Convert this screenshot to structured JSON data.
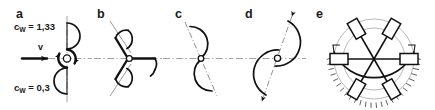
{
  "figure": {
    "background_color": "#ffffff",
    "ink_color": "#111111",
    "axis_color": "#8c8c8c",
    "width": 435,
    "height": 110
  },
  "panels": [
    {
      "letter": "a",
      "name": "half-shell-pair-rotor",
      "description": "Two half-shells on a vertical axis, one open to the flow, one closed",
      "labels": {
        "cw_top_prefix": "c",
        "cw_top_sub": "W",
        "cw_top_value": " = 1,33",
        "cw_top_full": "cW = 1,33",
        "cw_bottom_prefix": "c",
        "cw_bottom_sub": "W",
        "cw_bottom_value": " = 0,3",
        "cw_bottom_full": "cW = 0,3",
        "velocity": "v"
      }
    },
    {
      "letter": "b",
      "name": "three-cup-anemometer-rotor",
      "description": "Three arms at 120 degrees each carrying a half-shell cup"
    },
    {
      "letter": "c",
      "name": "two-blade-savonius-rotor-small",
      "description": "Two opposed half-shells on an inclined axis"
    },
    {
      "letter": "d",
      "name": "two-blade-savonius-rotor-large",
      "description": "Two large overlapping half-cylinders on an inclined axis"
    },
    {
      "letter": "e",
      "name": "shielded-six-blade-rotor",
      "description": "Six flat blades on radial spokes inside a hatched semicircular wind shield"
    }
  ]
}
